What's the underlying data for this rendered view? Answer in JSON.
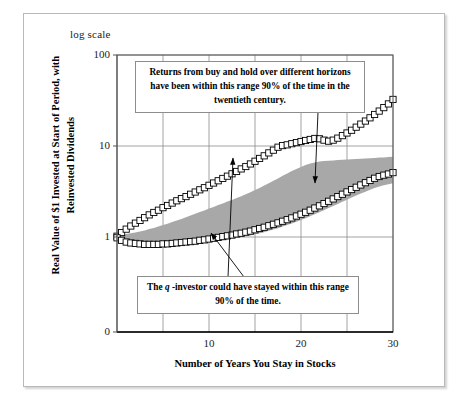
{
  "figure": {
    "scale_note": "log scale",
    "y_axis_title": "Real Value of $1  Invested at Start of Period, with Reinvested Dividends",
    "x_axis_title": "Number of Years You Stay in Stocks"
  },
  "annotations": {
    "top": "Returns from buy and hold over different horizons have been within this range 90% of the time in the twentieth century.",
    "bottom_pre": "The ",
    "bottom_italic": "q",
    "bottom_post": " -investor could have stayed within this range 90% of the time."
  },
  "colors": {
    "band": "#a8a8a8",
    "marker_fill": "#ffffff",
    "marker_stroke": "#000000",
    "grid": "#8c8c8c",
    "frame": "#b9b9b9"
  },
  "chart_data": {
    "type": "line",
    "title": "",
    "xlabel": "Number of Years You Stay in Stocks",
    "ylabel": "Real Value of $1  Invested at Start of Period, with Reinvested Dividends",
    "xlim": [
      0,
      30
    ],
    "ylim": [
      1,
      100
    ],
    "yscale": "log",
    "grid": true,
    "legend": "none",
    "xticks": [
      0,
      5,
      10,
      15,
      20,
      25,
      30
    ],
    "xticklabels": [
      "",
      "",
      "10",
      "",
      "20",
      "",
      "30"
    ],
    "yticks": [
      1,
      10,
      100
    ],
    "yticklabels": [
      "1",
      "10",
      "100"
    ],
    "y_axis_extra_tick": "0",
    "x": [
      0,
      0.5,
      1,
      1.5,
      2,
      2.5,
      3,
      3.5,
      4,
      4.5,
      5,
      5.5,
      6,
      6.5,
      7,
      7.5,
      8,
      8.5,
      9,
      9.5,
      10,
      10.5,
      11,
      11.5,
      12,
      12.5,
      13,
      13.5,
      14,
      14.5,
      15,
      15.5,
      16,
      16.5,
      17,
      17.5,
      18,
      18.5,
      19,
      19.5,
      20,
      20.5,
      21,
      21.5,
      22,
      22.5,
      23,
      23.5,
      24,
      24.5,
      25,
      25.5,
      26,
      26.5,
      27,
      27.5,
      28,
      28.5,
      29,
      29.5,
      30
    ],
    "series": [
      {
        "name": "Upper 95th percentile of buy-and-hold outcomes",
        "marker": "white-square",
        "values": [
          1.02,
          1.12,
          1.22,
          1.32,
          1.42,
          1.52,
          1.63,
          1.75,
          1.86,
          1.97,
          2.1,
          2.22,
          2.36,
          2.5,
          2.64,
          2.78,
          2.95,
          3.12,
          3.3,
          3.48,
          3.7,
          3.92,
          4.15,
          4.4,
          4.66,
          4.95,
          5.25,
          5.6,
          5.95,
          6.35,
          6.8,
          7.3,
          7.8,
          8.4,
          9.0,
          9.7,
          10.1,
          10.3,
          10.6,
          10.9,
          11.2,
          11.5,
          11.8,
          12.1,
          12.0,
          11.6,
          11.3,
          11.6,
          12.2,
          13.0,
          13.9,
          14.9,
          16.1,
          17.4,
          18.8,
          20.4,
          22.2,
          24.2,
          26.4,
          29.0,
          32.5
        ]
      },
      {
        "name": "Lower 5th percentile of buy-and-hold outcomes",
        "marker": "white-square",
        "values": [
          0.98,
          0.92,
          0.88,
          0.86,
          0.85,
          0.84,
          0.83,
          0.83,
          0.83,
          0.83,
          0.84,
          0.84,
          0.85,
          0.86,
          0.87,
          0.88,
          0.89,
          0.9,
          0.92,
          0.93,
          0.95,
          0.97,
          0.99,
          1.01,
          1.03,
          1.05,
          1.08,
          1.1,
          1.13,
          1.16,
          1.2,
          1.24,
          1.28,
          1.33,
          1.38,
          1.43,
          1.49,
          1.55,
          1.62,
          1.7,
          1.78,
          1.87,
          1.97,
          2.08,
          2.2,
          2.33,
          2.47,
          2.62,
          2.78,
          2.95,
          3.13,
          3.32,
          3.52,
          3.73,
          3.95,
          4.18,
          4.42,
          4.62,
          4.78,
          4.92,
          5.1
        ]
      }
    ],
    "band": {
      "name": "q-investor 90% range (shaded)",
      "fill": "#a8a8a8",
      "upper": [
        1.0,
        1.05,
        1.08,
        1.1,
        1.12,
        1.15,
        1.18,
        1.22,
        1.26,
        1.3,
        1.35,
        1.4,
        1.46,
        1.52,
        1.58,
        1.65,
        1.72,
        1.8,
        1.88,
        1.96,
        2.05,
        2.14,
        2.24,
        2.34,
        2.45,
        2.56,
        2.68,
        2.8,
        2.95,
        3.1,
        3.28,
        3.46,
        3.68,
        3.9,
        4.15,
        4.4,
        4.7,
        5.0,
        5.3,
        5.6,
        5.9,
        6.2,
        6.4,
        6.6,
        6.75,
        6.85,
        6.9,
        6.95,
        7.0,
        7.05,
        7.1,
        7.15,
        7.2,
        7.25,
        7.3,
        7.35,
        7.4,
        7.45,
        7.5,
        7.55,
        7.6
      ],
      "lower": [
        1.0,
        0.9,
        0.84,
        0.81,
        0.79,
        0.78,
        0.77,
        0.77,
        0.77,
        0.77,
        0.78,
        0.78,
        0.79,
        0.8,
        0.81,
        0.82,
        0.83,
        0.84,
        0.85,
        0.86,
        0.88,
        0.89,
        0.91,
        0.92,
        0.94,
        0.96,
        0.98,
        1.0,
        1.02,
        1.04,
        1.07,
        1.1,
        1.13,
        1.17,
        1.21,
        1.25,
        1.3,
        1.35,
        1.41,
        1.47,
        1.54,
        1.61,
        1.69,
        1.78,
        1.87,
        1.97,
        2.08,
        2.19,
        2.31,
        2.44,
        2.57,
        2.71,
        2.85,
        3.0,
        3.15,
        3.3,
        3.45,
        3.58,
        3.7,
        3.8,
        3.9
      ]
    },
    "arrows": [
      {
        "name": "arrow-top-box-to-band",
        "from": [
          318,
          112
        ],
        "to": [
          315,
          183
        ]
      },
      {
        "name": "arrow-bottom-box-to-upper-series",
        "from": [
          228,
          277
        ],
        "to": [
          233,
          158
        ]
      },
      {
        "name": "arrow-bottom-box-to-lower-series",
        "from": [
          244,
          277
        ],
        "to": [
          211,
          233
        ]
      }
    ]
  }
}
